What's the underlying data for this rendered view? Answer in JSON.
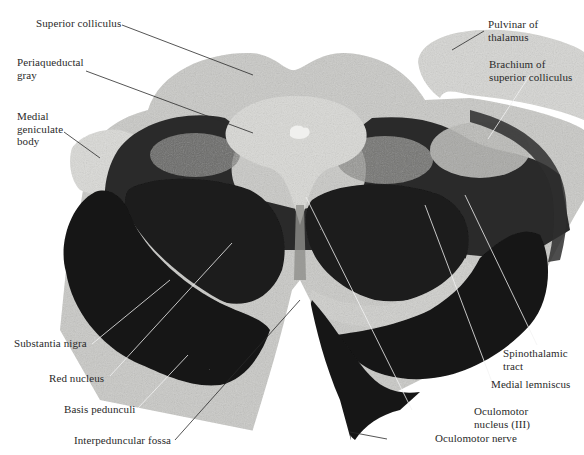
{
  "figure": {
    "colors": {
      "background": "#ffffff",
      "tissue_light": "#d9d9d6",
      "tissue_mid": "#a9a9a6",
      "tissue_dark": "#161616",
      "leader_dark": "#2a2a2a",
      "leader_light": "#f2f2f2"
    }
  },
  "labels": {
    "superior_colliculus": "Superior colliculus",
    "periaqueductal_gray": "Periaqueductal\ngray",
    "medial_geniculate_body": "Medial\ngeniculate\nbody",
    "pulvinar_of_thalamus": "Pulvinar of\nthalamus",
    "brachium_of_superior_colliculus": "Brachium of\nsuperior colliculus",
    "substantia_nigra": "Substantia nigra",
    "red_nucleus": "Red nucleus",
    "basis_pedunculi": "Basis pedunculi",
    "interpeduncular_fossa": "Interpeduncular fossa",
    "spinothalamic_tract": "Spinothalamic\ntract",
    "medial_lemniscus": "Medial lemniscus",
    "oculomotor_nucleus": "Oculomotor\nnucleus (III)",
    "oculomotor_nerve": "Oculomotor nerve"
  }
}
